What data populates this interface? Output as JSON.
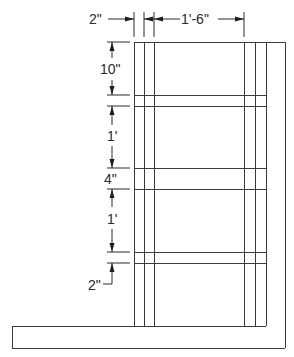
{
  "drawing": {
    "description": "Section elevation of a wall/frame with framing members on a base slab",
    "line_color": "#3a3a3a",
    "background": "#ffffff"
  },
  "dimensions": {
    "top_left": {
      "label": "2\""
    },
    "top_right": {
      "label": "1'-6\""
    },
    "left_1": {
      "label": "10\""
    },
    "left_2": {
      "label": "1'"
    },
    "left_3": {
      "label": "4\""
    },
    "left_4": {
      "label": "1'"
    },
    "left_5": {
      "label": "2\""
    }
  }
}
